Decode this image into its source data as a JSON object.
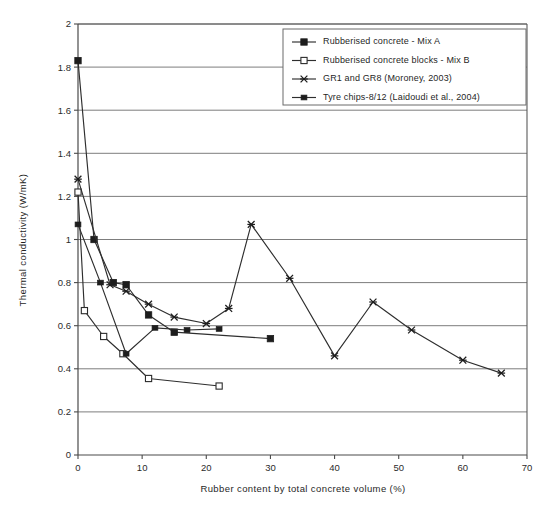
{
  "chart_data": {
    "type": "line",
    "title": "",
    "xlabel": "Rubber content by total concrete volume (%)",
    "ylabel": "Thermal conductivity (W/mK)",
    "xlim": [
      0,
      70
    ],
    "ylim": [
      0,
      2
    ],
    "xticks": [
      "0",
      "10",
      "20",
      "30",
      "40",
      "50",
      "60",
      "70"
    ],
    "xtick_values": [
      0,
      10,
      20,
      30,
      40,
      50,
      60,
      70
    ],
    "yticks": [
      "0",
      "0.2",
      "0.4",
      "0.6",
      "0.8",
      "1",
      "1.2",
      "1.4",
      "1.6",
      "1.8",
      "2"
    ],
    "ytick_values": [
      0,
      0.2,
      0.4,
      0.6,
      0.8,
      1,
      1.2,
      1.4,
      1.6,
      1.8,
      2
    ],
    "grid": "horizontal",
    "legend_position": "top-center",
    "series": [
      {
        "name": "Rubberised concrete - Mix A",
        "marker": "filled-square",
        "x": [
          0,
          2.5,
          5.5,
          7.5,
          11,
          15,
          30
        ],
        "y": [
          1.83,
          1.0,
          0.8,
          0.79,
          0.65,
          0.57,
          0.54
        ]
      },
      {
        "name": "Rubberised concrete blocks - Mix B",
        "marker": "open-square",
        "x": [
          0,
          1,
          4,
          7,
          11,
          22
        ],
        "y": [
          1.22,
          0.67,
          0.55,
          0.47,
          0.355,
          0.32
        ]
      },
      {
        "name": "GR1 and GR8 (Moroney, 2003)",
        "marker": "cross-x",
        "x": [
          0,
          5,
          7.5,
          11,
          15,
          20,
          23.5,
          27,
          33,
          40,
          46,
          52,
          60,
          66
        ],
        "y": [
          1.28,
          0.79,
          0.76,
          0.7,
          0.64,
          0.61,
          0.68,
          1.07,
          0.82,
          0.46,
          0.71,
          0.58,
          0.44,
          0.38
        ]
      },
      {
        "name": "Tyre chips-8/12 (Laidoudi et al., 2004)",
        "marker": "filled-square-small",
        "x": [
          0,
          3.5,
          7.5,
          12,
          17,
          22
        ],
        "y": [
          1.07,
          0.8,
          0.47,
          0.59,
          0.58,
          0.585
        ]
      }
    ]
  },
  "legend": {
    "entries": [
      {
        "label": "Rubberised concrete - Mix A",
        "marker": "filled-square"
      },
      {
        "label": "Rubberised concrete blocks - Mix B",
        "marker": "open-square"
      },
      {
        "label": "GR1 and GR8 (Moroney, 2003)",
        "marker": "cross-x"
      },
      {
        "label": "Tyre chips-8/12 (Laidoudi et al., 2004)",
        "marker": "filled-square-small"
      }
    ]
  },
  "axes": {
    "x_title": "Rubber content by total concrete volume (%)",
    "y_title": "Thermal conductivity (W/mK)"
  },
  "colors": {
    "line": "#2e2e2e",
    "grid": "#6e6e6e",
    "frame": "#5a5a5a",
    "text": "#1f1f1f",
    "background": "#ffffff"
  }
}
